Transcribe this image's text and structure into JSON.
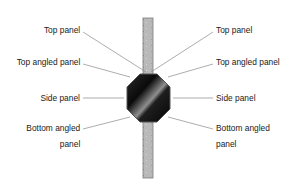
{
  "diagram": {
    "left_labels": [
      {
        "id": "top-panel",
        "text": "Top panel"
      },
      {
        "id": "top-angled-panel",
        "text": "Top angled panel"
      },
      {
        "id": "side-panel",
        "text": "Side panel"
      },
      {
        "id": "bottom-angled-panel",
        "line1": "Bottom  angled",
        "line2": "panel"
      }
    ],
    "right_labels": [
      {
        "id": "top-panel",
        "text": "Top panel"
      },
      {
        "id": "top-angled-panel",
        "text": "Top angled panel"
      },
      {
        "id": "side-panel",
        "text": "Side panel"
      },
      {
        "id": "bottom-angled-panel",
        "line1": "Bottom  angled",
        "line2": "panel"
      }
    ],
    "colors": {
      "rod": "#b8b8b8",
      "octagon_dark": "#0d0d0d",
      "octagon_highlight": "#9a9a9a",
      "leader_line": "#8a8a8a",
      "text": "#1a1a1a"
    }
  }
}
